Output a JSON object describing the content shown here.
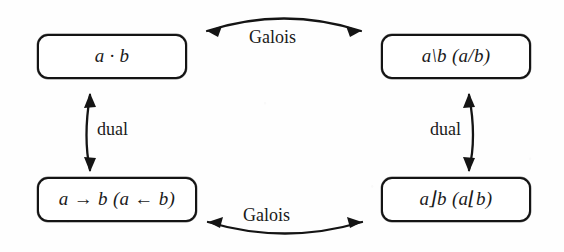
{
  "figure": {
    "background_color": "#fefefe",
    "ink_color": "#141414"
  },
  "nodes": [
    {
      "id": "product",
      "position": "top-left",
      "label": "a · b",
      "operator": "product"
    },
    {
      "id": "residual",
      "position": "top-right",
      "label": "a\\b   (a/b)",
      "operator": "residual"
    },
    {
      "id": "implication",
      "position": "bottom-left",
      "label": "a → b   (a ← b)",
      "operator": "implication"
    },
    {
      "id": "difference",
      "position": "bottom-right",
      "label": "a⌋b   (a⌊b)",
      "operator": "difference"
    }
  ],
  "edges": [
    {
      "id": "galois-top",
      "label": "Galois",
      "from": "product",
      "to": "residual",
      "direction": "bidirectional",
      "orientation": "horizontal",
      "curve": "arc-up"
    },
    {
      "id": "galois-bottom",
      "label": "Galois",
      "from": "implication",
      "to": "difference",
      "direction": "bidirectional",
      "orientation": "horizontal",
      "curve": "arc-down"
    },
    {
      "id": "dual-left",
      "label": "dual",
      "from": "product",
      "to": "implication",
      "direction": "bidirectional",
      "orientation": "vertical",
      "curve": "arc-left"
    },
    {
      "id": "dual-right",
      "label": "dual",
      "from": "residual",
      "to": "difference",
      "direction": "bidirectional",
      "orientation": "vertical",
      "curve": "arc-right"
    }
  ]
}
